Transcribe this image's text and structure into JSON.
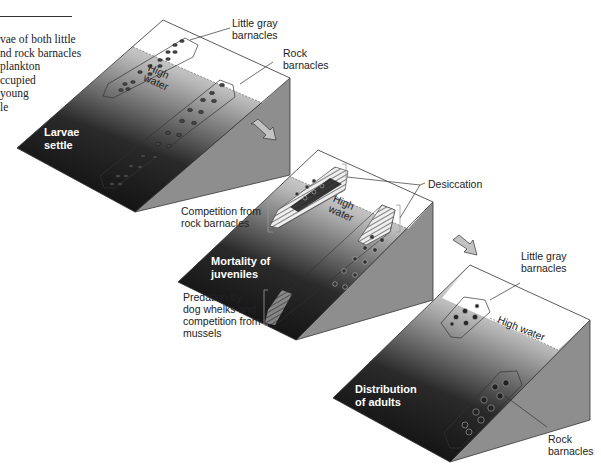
{
  "caption": {
    "lines": [
      "vae of both little",
      "nd rock barnacles",
      "plankton",
      "ccupied",
      "young",
      "le"
    ]
  },
  "panel1": {
    "stage_label": "Larvae\nsettle",
    "label_little_gray": "Little gray\nbarnacles",
    "label_rock": "Rock\nbarnacles",
    "high_water": "High\nwater"
  },
  "panel2": {
    "stage_label": "Mortality of\njuveniles",
    "label_desiccation": "Desiccation",
    "label_competition": "Competition from\nrock barnacles",
    "label_predation": "Predation by\ndog whelks and\ncompetition from\nmussels",
    "high_water": "High\nwater"
  },
  "panel3": {
    "stage_label": "Distribution\nof adults",
    "label_little_gray": "Little gray\nbarnacles",
    "label_rock": "Rock\nbarnacles",
    "high_water": "High water"
  },
  "colors": {
    "slope_dark": "#0a0a0a",
    "slope_light": "#f4f4f4",
    "side_face": "#8c8c8c",
    "arrow_fill": "#bdbdbd"
  }
}
